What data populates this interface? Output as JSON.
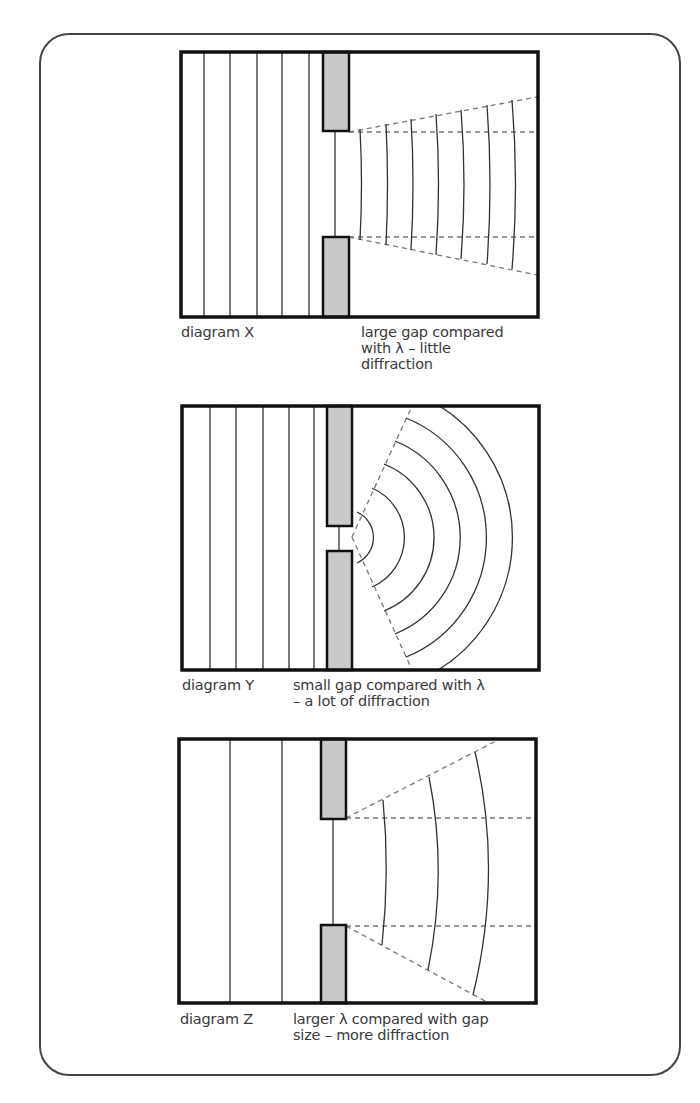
{
  "figure": {
    "topic": "diffraction of waves through a gap",
    "colors": {
      "outline": "#111111",
      "wave": "#333333",
      "dashed": "#777777",
      "barrier_fill": "#c9c9c9",
      "frame": "#444444",
      "text": "#3a3a3a"
    }
  },
  "diagrams": [
    {
      "id": "X",
      "label": "diagram X",
      "description": "large gap compared\nwith λ – little\ndiffraction",
      "gap": "large",
      "incident_wavefronts": 5,
      "diffracted_wavefronts": 7
    },
    {
      "id": "Y",
      "label": "diagram Y",
      "description": "small gap compared with λ\n– a lot of diffraction",
      "gap": "small",
      "incident_wavefronts": 5,
      "diffracted_wavefronts": 6
    },
    {
      "id": "Z",
      "label": "diagram Z",
      "description": "larger λ compared with gap\nsize – more diffraction",
      "gap": "large",
      "incident_wavefronts": 2,
      "diffracted_wavefronts": 3
    }
  ]
}
